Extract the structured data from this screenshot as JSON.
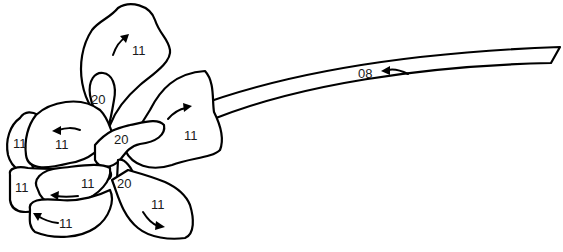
{
  "diagram": {
    "type": "flower-line-art",
    "stroke_color": "#000000",
    "background": "#ffffff"
  },
  "labels": {
    "top_petal": "11",
    "top_inner": "20",
    "right_petal": "11",
    "center": "20",
    "left_outer": "11",
    "left_inner": "11",
    "lower_left_outer": "11",
    "lower_left_inner": "11",
    "bottom_left": "11",
    "lower_center": "20",
    "bottom_right": "11",
    "stem": "08"
  }
}
